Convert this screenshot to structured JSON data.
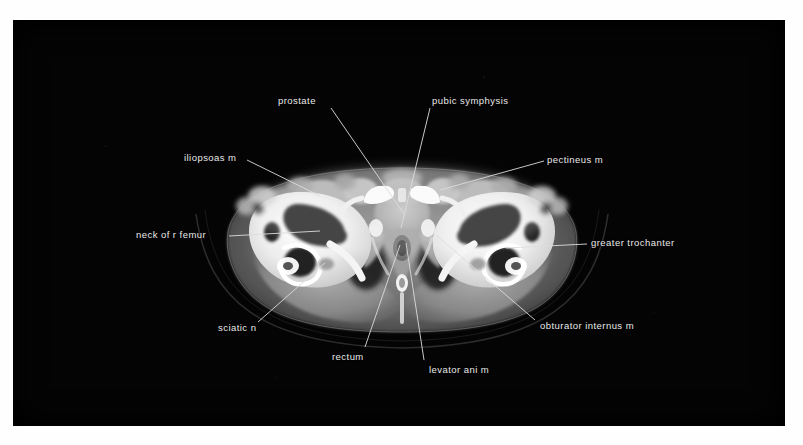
{
  "figure": {
    "kind": "ct-axial-pelvis",
    "plate_background": "#040404",
    "page_background": "#fefefe",
    "label_color": "#e9e9e9",
    "leader_color": "#dcdcdc"
  },
  "labels": [
    {
      "id": "prostate",
      "text": "prostate",
      "x": 278,
      "y": 95,
      "anchor": "start",
      "leader": [
        [
          331,
          108
        ],
        [
          404,
          214
        ]
      ]
    },
    {
      "id": "pubic-symphysis",
      "text": "pubic symphysis",
      "x": 432,
      "y": 95,
      "anchor": "start",
      "leader": [
        [
          430,
          108
        ],
        [
          401,
          228
        ]
      ]
    },
    {
      "id": "iliopsoas-m",
      "text": "iliopsoas m",
      "x": 184,
      "y": 152,
      "anchor": "start",
      "leader": [
        [
          247,
          160
        ],
        [
          320,
          196
        ]
      ]
    },
    {
      "id": "pectineus-m",
      "text": "pectineus m",
      "x": 547,
      "y": 154,
      "anchor": "start",
      "leader": [
        [
          544,
          161
        ],
        [
          440,
          190
        ]
      ]
    },
    {
      "id": "neck-of-r-femur",
      "text": "neck of r femur",
      "x": 136,
      "y": 229,
      "anchor": "start",
      "leader": [
        [
          229,
          236
        ],
        [
          320,
          231
        ]
      ]
    },
    {
      "id": "greater-trochanter",
      "text": "greater trochanter",
      "x": 591,
      "y": 237,
      "anchor": "start",
      "leader": [
        [
          587,
          244
        ],
        [
          506,
          248
        ]
      ]
    },
    {
      "id": "sciatic-n",
      "text": "sciatic n",
      "x": 218,
      "y": 322,
      "anchor": "start",
      "leader": [
        [
          258,
          322
        ],
        [
          325,
          263
        ]
      ]
    },
    {
      "id": "obturator-internus-m",
      "text": "obturator internus m",
      "x": 540,
      "y": 320,
      "anchor": "start",
      "leader": [
        [
          535,
          320
        ],
        [
          436,
          235
        ]
      ]
    },
    {
      "id": "rectum",
      "text": "rectum",
      "x": 332,
      "y": 351,
      "anchor": "start",
      "leader": [
        [
          365,
          347
        ],
        [
          400,
          245
        ]
      ]
    },
    {
      "id": "levator-ani-m",
      "text": "levator ani m",
      "x": 429,
      "y": 364,
      "anchor": "start",
      "leader": [
        [
          424,
          360
        ],
        [
          406,
          243
        ]
      ]
    }
  ],
  "anatomy": {
    "body_outline_label": "pelvis-axial-section",
    "structures": [
      "subcutaneous-fat",
      "gluteal-muscle",
      "femoral-head-right",
      "femoral-head-left",
      "acetabulum-right",
      "acetabulum-left",
      "pubic-bone",
      "prostate-gland",
      "rectum-lumen",
      "coccyx"
    ]
  }
}
